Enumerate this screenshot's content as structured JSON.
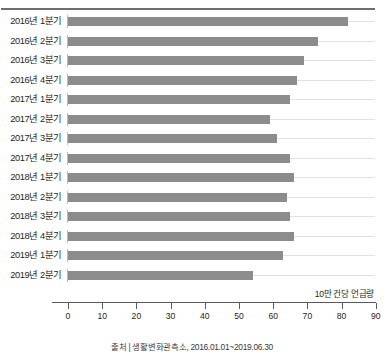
{
  "chart_data": {
    "type": "bar",
    "orientation": "horizontal",
    "title": "",
    "xlabel": "10만 건당 언급량",
    "ylabel": "",
    "xlim": [
      0,
      90
    ],
    "xticks": [
      0,
      10,
      20,
      30,
      40,
      50,
      60,
      70,
      80,
      90
    ],
    "grid": true,
    "legend": null,
    "categories": [
      "2016년 1분기",
      "2016년 2분기",
      "2016년 3분기",
      "2016년 4분기",
      "2017년 1분기",
      "2017년 2분기",
      "2017년 3분기",
      "2017년 4분기",
      "2018년 1분기",
      "2018년 2분기",
      "2018년 3분기",
      "2018년 4분기",
      "2019년 1분기",
      "2019년 2분기"
    ],
    "values": [
      82,
      73,
      69,
      67,
      65,
      59,
      61,
      65,
      66,
      64,
      65,
      66,
      63,
      54
    ],
    "source": "출처 | 생활변화관측소, 2016.01.01~2019.06.30",
    "bar_color": "#8c8c8c"
  }
}
